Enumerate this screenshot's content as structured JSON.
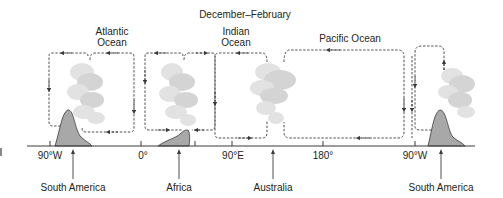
{
  "title": "December–February",
  "oceans": [
    {
      "line1": "Atlantic",
      "line2": "Ocean"
    },
    {
      "line1": "Indian",
      "line2": "Ocean"
    },
    {
      "label": "Pacific Ocean"
    }
  ],
  "axis": {
    "ticks": [
      "90°W",
      "0°",
      "90°E",
      "180°",
      "90°W"
    ]
  },
  "continents": [
    "South America",
    "Africa",
    "Australia",
    "South America"
  ],
  "colors": {
    "land": "#a8a8a8",
    "cloud": "#d4d4d4",
    "line": "#3a3a3a",
    "text": "#231f20"
  }
}
